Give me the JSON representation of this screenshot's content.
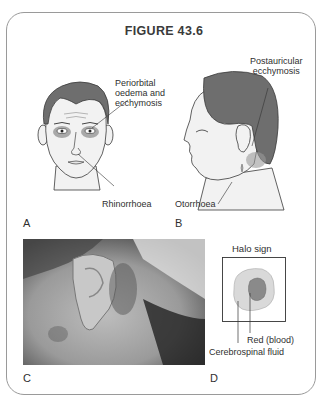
{
  "figure": {
    "title": "FIGURE 43.6"
  },
  "panels": {
    "A": {
      "letter": "A",
      "labels": {
        "periorbital_line1": "Periorbital",
        "periorbital_line2": "oedema and",
        "periorbital_line3": "ecchymosis",
        "rhinorrhoea": "Rhinorrhoea"
      }
    },
    "B": {
      "letter": "B",
      "labels": {
        "postauricular_line1": "Postauricular",
        "postauricular_line2": "ecchymosis",
        "otorrhoea": "Otorrhoea"
      }
    },
    "C": {
      "letter": "C",
      "description": "Photograph of postauricular bruising behind the ear"
    },
    "D": {
      "letter": "D",
      "labels": {
        "title": "Halo sign",
        "red": "Red (blood)",
        "csf": "Cerebrospinal fluid"
      }
    }
  },
  "colors": {
    "hair": "#6e6e6e",
    "skin": "#f2f2f2",
    "outline": "#3a3a3a",
    "border": "#9a9a9a",
    "halo_outer": "#d9d9d9",
    "halo_inner": "#8a8a8a"
  }
}
